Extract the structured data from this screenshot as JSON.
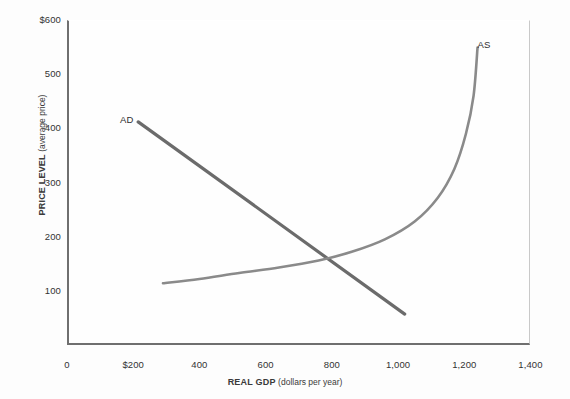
{
  "chart_data": {
    "type": "line",
    "title": "",
    "xlabel_bold": "REAL GDP",
    "xlabel_normal": "(dollars per year)",
    "ylabel_bold": "PRICE LEVEL",
    "ylabel_normal": "(average price)",
    "xlim": [
      0,
      1400
    ],
    "ylim": [
      0,
      600
    ],
    "grid": false,
    "legend_position": "inline-annotation",
    "xticks": [
      {
        "value": 0,
        "label": "0"
      },
      {
        "value": 200,
        "label": "$200"
      },
      {
        "value": 400,
        "label": "400"
      },
      {
        "value": 600,
        "label": "600"
      },
      {
        "value": 800,
        "label": "800"
      },
      {
        "value": 1000,
        "label": "1,000"
      },
      {
        "value": 1200,
        "label": "1,200"
      },
      {
        "value": 1400,
        "label": "1,400"
      }
    ],
    "yticks": [
      {
        "value": 100,
        "label": "100"
      },
      {
        "value": 200,
        "label": "200"
      },
      {
        "value": 300,
        "label": "300"
      },
      {
        "value": 400,
        "label": "400"
      },
      {
        "value": 500,
        "label": "500"
      },
      {
        "value": 600,
        "label": "$600"
      }
    ],
    "series": [
      {
        "name": "AD",
        "label": "AD",
        "kind": "straight-line",
        "color": "#6b6b6b",
        "linewidth": 3.2,
        "annotation_xy": [
          190,
          415
        ],
        "points": [
          {
            "x": 215,
            "y": 412
          },
          {
            "x": 1020,
            "y": 57
          }
        ]
      },
      {
        "name": "AS",
        "label": "AS",
        "kind": "curve",
        "color": "#8a8a8a",
        "linewidth": 2.6,
        "annotation_xy": [
          1270,
          553
        ],
        "points": [
          {
            "x": 290,
            "y": 114
          },
          {
            "x": 400,
            "y": 122
          },
          {
            "x": 520,
            "y": 133
          },
          {
            "x": 640,
            "y": 143
          },
          {
            "x": 760,
            "y": 156
          },
          {
            "x": 860,
            "y": 172
          },
          {
            "x": 960,
            "y": 195
          },
          {
            "x": 1050,
            "y": 228
          },
          {
            "x": 1120,
            "y": 272
          },
          {
            "x": 1170,
            "y": 325
          },
          {
            "x": 1205,
            "y": 390
          },
          {
            "x": 1228,
            "y": 460
          },
          {
            "x": 1240,
            "y": 549
          }
        ]
      }
    ],
    "equilibrium": {
      "x": 805,
      "y": 150
    },
    "colors": {
      "ad_line": "#6b6b6b",
      "as_line": "#8a8a8a",
      "axis": "#6f6f6f",
      "background": "#fdfdfd",
      "text": "#333333"
    }
  }
}
